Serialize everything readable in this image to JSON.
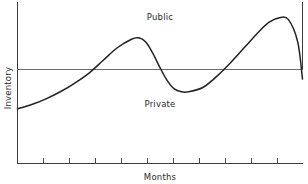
{
  "chart_data": {
    "type": "line",
    "title": "",
    "subtitle": "",
    "xlabel": "Months",
    "ylabel": "Inventory",
    "grid": false,
    "legend_position": "none",
    "xlim": [
      0,
      12
    ],
    "ylim": [
      0,
      10
    ],
    "axis_ticks_x_count": 11,
    "reference_line": {
      "value": 5.0,
      "orientation": "horizontal",
      "label_above": "Public",
      "label_below": "Private"
    },
    "annotations": [
      {
        "text": "Public",
        "x": 6.0,
        "y": 8.6
      },
      {
        "text": "Private",
        "x": 6.0,
        "y": 2.9
      }
    ],
    "series": [
      {
        "name": "Inventory",
        "color": "#222222",
        "x": [
          0.0,
          0.6,
          1.2,
          1.8,
          2.4,
          3.0,
          3.6,
          4.2,
          4.8,
          5.1,
          5.4,
          5.7,
          6.0,
          6.3,
          6.6,
          6.9,
          7.2,
          7.8,
          8.4,
          9.0,
          9.6,
          10.2,
          10.6,
          11.0,
          11.4,
          11.8,
          12.0
        ],
        "y": [
          2.9,
          3.2,
          3.6,
          4.1,
          4.7,
          5.4,
          6.3,
          7.2,
          7.8,
          7.9,
          7.6,
          6.8,
          5.8,
          4.9,
          4.3,
          4.1,
          4.1,
          4.4,
          5.2,
          6.2,
          7.3,
          8.4,
          9.0,
          9.3,
          9.2,
          7.6,
          5.0
        ]
      }
    ]
  },
  "axes": {
    "x_axis_label": "Months",
    "y_axis_label": "Inventory"
  },
  "regions": {
    "upper_label": "Public",
    "lower_label": "Private"
  },
  "colors": {
    "series_stroke": "#222222",
    "axis_stroke": "#3c3c3c",
    "divider_stroke": "#6b6b6b",
    "background": "#ffffff",
    "text": "#2a2a2a"
  }
}
